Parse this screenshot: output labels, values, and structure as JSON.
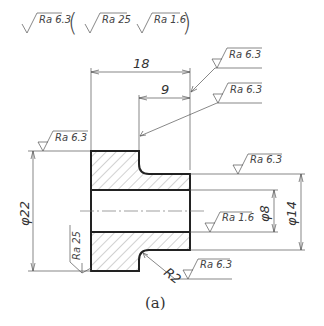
{
  "figure": {
    "caption": "(a)",
    "general_roughness": {
      "symbol": "Ra 6.3",
      "others_in_parens": [
        "Ra 25",
        "Ra 1.6"
      ]
    },
    "dimensions": {
      "length_total": "18",
      "length_step": "9",
      "outer_diameter": "φ22",
      "shoulder_diameter": "φ14",
      "bore_diameter": "φ8",
      "fillet_radius": "R2"
    },
    "roughness_callouts": {
      "right_face_top": "Ra 6.3",
      "step_face": "Ra 6.3",
      "left_face": "Ra 6.3",
      "shoulder_surface": "Ra 6.3",
      "bore_surface": "Ra 1.6",
      "outer_left_side": "Ra 25",
      "fillet": "Ra 6.3"
    }
  }
}
